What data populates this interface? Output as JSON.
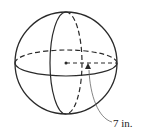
{
  "diagram": {
    "shape": "sphere",
    "radius_label": "7 in.",
    "colors": {
      "stroke": "#2a2a2a",
      "background": "#ffffff"
    }
  }
}
